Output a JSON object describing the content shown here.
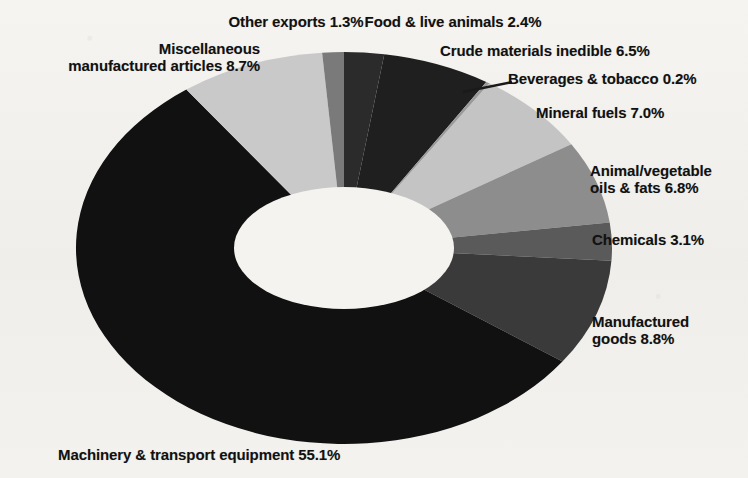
{
  "chart_data": {
    "type": "pie",
    "title": "",
    "subtitle": "",
    "xlabel": "",
    "ylabel": "",
    "legend_position": "none",
    "grid": false,
    "donut": true,
    "units": "percent",
    "categories": [
      "Food & live animals",
      "Crude materials inedible",
      "Beverages & tobacco",
      "Mineral fuels",
      "Animal/vegetable oils & fats",
      "Chemicals",
      "Manufactured goods",
      "Machinery & transport equipment",
      "Miscellaneous manufactured articles",
      "Other exports"
    ],
    "values": [
      2.4,
      6.5,
      0.2,
      7.0,
      6.8,
      3.1,
      8.8,
      55.1,
      8.7,
      1.3
    ],
    "slice_colors": [
      "#2b2b2b",
      "#1f1f1f",
      "#9a9a9a",
      "#c4c4c4",
      "#8d8d8d",
      "#5a5a5a",
      "#3a3a3a",
      "#111111",
      "#c9c9c9",
      "#7a7a7a"
    ]
  },
  "labels": {
    "misc": "Miscellaneous\nmanufactured articles 8.7%",
    "other_exports": "Other exports 1.3%",
    "food": "Food & live animals 2.4%",
    "crude": "Crude materials inedible 6.5%",
    "beverages": "Beverages & tobacco 0.2%",
    "mineral": "Mineral fuels 7.0%",
    "oils": "Animal/vegetable\noils & fats 6.8%",
    "chemicals": "Chemicals 3.1%",
    "manufactured_goods": "Manufactured\ngoods 8.8%",
    "machinery": "Machinery & transport equipment 55.1%"
  },
  "colors": {
    "page_background": "#f2f1ee",
    "text": "#111111",
    "leader_line": "#1a1a1a",
    "donut_hole": "#f4f3f0"
  }
}
